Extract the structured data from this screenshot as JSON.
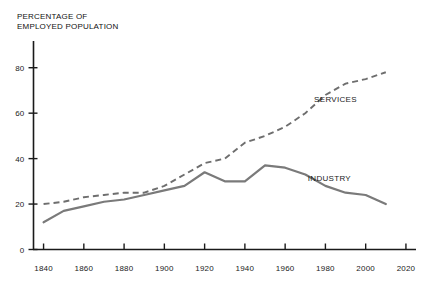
{
  "chart_data": {
    "type": "line",
    "title": "PERCENTAGE OF\nEMPLOYED POPULATION",
    "xlabel": "",
    "ylabel": "PERCENTAGE OF EMPLOYED POPULATION",
    "xlim": [
      1835,
      2025
    ],
    "ylim": [
      0,
      90
    ],
    "grid": false,
    "legend_position": "inline-annotations",
    "xticks": [
      1840,
      1860,
      1880,
      1900,
      1920,
      1940,
      1960,
      1980,
      2000,
      2020
    ],
    "xtick_labels": [
      "1840",
      "1860",
      "1880",
      "1900",
      "1920",
      "1940",
      "1960",
      "1980",
      "2000",
      "2020"
    ],
    "yticks": [
      0,
      20,
      40,
      60,
      80
    ],
    "ytick_labels": [
      "0",
      "20",
      "40",
      "60",
      "80"
    ],
    "series": [
      {
        "name": "SERVICES",
        "style": "dashed",
        "color": "#6e6e6e",
        "label": "SERVICES",
        "x": [
          1840,
          1850,
          1860,
          1870,
          1880,
          1890,
          1900,
          1910,
          1920,
          1930,
          1940,
          1950,
          1960,
          1970,
          1980,
          1990,
          2000,
          2010
        ],
        "values": [
          20,
          21,
          23,
          24,
          25,
          25,
          28,
          33,
          38,
          40,
          47,
          50,
          54,
          60,
          68,
          73,
          75,
          78
        ]
      },
      {
        "name": "INDUSTRY",
        "style": "solid",
        "color": "#7a7a7a",
        "label": "INDUSTRY",
        "x": [
          1840,
          1850,
          1860,
          1870,
          1880,
          1890,
          1900,
          1910,
          1920,
          1930,
          1940,
          1950,
          1960,
          1970,
          1980,
          1990,
          2000,
          2010
        ],
        "values": [
          12,
          17,
          19,
          21,
          22,
          24,
          26,
          28,
          34,
          30,
          30,
          37,
          36,
          33,
          28,
          25,
          24,
          20
        ]
      }
    ],
    "annotations": [
      {
        "text": "SERVICES",
        "x": 1985,
        "y": 65
      },
      {
        "text": "INDUSTRY",
        "x": 1982,
        "y": 30
      }
    ]
  }
}
